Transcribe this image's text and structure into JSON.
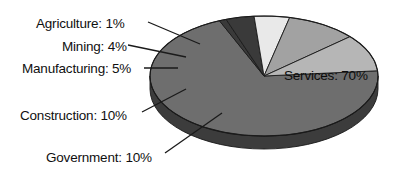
{
  "chart_data": {
    "type": "pie",
    "title": "",
    "subtitle": "",
    "xlabel": "",
    "ylabel": "",
    "legend_position": "none",
    "grid": false,
    "three_d": true,
    "total_percent": 100,
    "categories": [
      "Services",
      "Agriculture",
      "Mining",
      "Manufacturing",
      "Construction",
      "Government"
    ],
    "values": [
      70,
      1,
      4,
      5,
      10,
      10
    ],
    "labels": [
      "Services: 70%",
      "Agriculture: 1%",
      "Mining: 4%",
      "Manufacturing: 5%",
      "Construction: 10%",
      "Government: 10%"
    ],
    "slices": [
      {
        "name": "Services",
        "label": "Services: 70%",
        "value": 70,
        "unit": "%",
        "color": "#6e6e6e",
        "side_color": "#3c3c3c",
        "label_placement": "inside",
        "label_x": 284,
        "label_y": 69
      },
      {
        "name": "Agriculture",
        "label": "Agriculture: 1%",
        "value": 1,
        "unit": "%",
        "color": "#3a3a3a",
        "side_color": "#242424",
        "label_placement": "callout-left",
        "label_x": 36,
        "label_y": 17,
        "leader_from_x": 148,
        "leader_from_y": 22,
        "leader_to_x": 200,
        "leader_to_y": 44
      },
      {
        "name": "Mining",
        "label": "Mining: 4%",
        "value": 4,
        "unit": "%",
        "color": "#3a3a3a",
        "side_color": "#242424",
        "label_placement": "callout-left",
        "label_x": 62,
        "label_y": 40,
        "leader_from_x": 128,
        "leader_from_y": 45,
        "leader_to_x": 186,
        "leader_to_y": 57
      },
      {
        "name": "Manufacturing",
        "label": "Manufacturing: 5%",
        "value": 5,
        "unit": "%",
        "color": "#e9e9e9",
        "side_color": "#9c9c9c",
        "label_placement": "callout-left",
        "label_x": 22,
        "label_y": 62,
        "leader_from_x": 144,
        "leader_from_y": 68,
        "leader_to_x": 178,
        "leader_to_y": 68
      },
      {
        "name": "Construction",
        "label": "Construction: 10%",
        "value": 10,
        "unit": "%",
        "color": "#a2a2a2",
        "side_color": "#5a5a5a",
        "label_placement": "callout-left",
        "label_x": 20,
        "label_y": 109,
        "leader_from_x": 142,
        "leader_from_y": 112,
        "leader_to_x": 186,
        "leader_to_y": 89
      },
      {
        "name": "Government",
        "label": "Government: 10%",
        "value": 10,
        "unit": "%",
        "color": "#b6b6b6",
        "side_color": "#6a6a6a",
        "label_placement": "callout-left",
        "label_x": 46,
        "label_y": 151,
        "leader_from_x": 165,
        "leader_from_y": 153,
        "leader_to_x": 222,
        "leader_to_y": 113
      }
    ],
    "geometry": {
      "center_x": 264,
      "center_y": 76,
      "radius_x": 114,
      "radius_y": 60,
      "depth": 13
    },
    "colors": {
      "background": "#ffffff",
      "text": "#101010",
      "outline": "#1a1a1a",
      "leader_line": "#1a1a1a"
    }
  }
}
